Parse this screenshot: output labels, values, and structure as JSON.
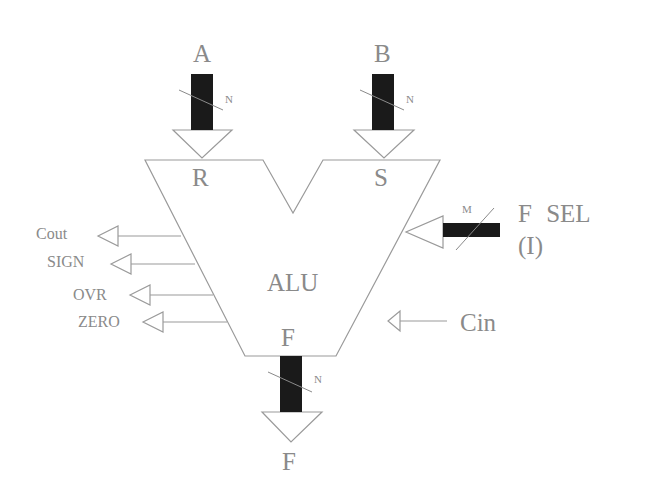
{
  "diagram": {
    "block_label": "ALU",
    "inputs": [
      {
        "name": "A",
        "port": "R",
        "width_label": "N"
      },
      {
        "name": "B",
        "port": "S",
        "width_label": "N"
      }
    ],
    "function_select": {
      "label_line1": "F SEL",
      "label_line2": "(I)",
      "width_label": "M"
    },
    "carry_in": {
      "label": "Cin"
    },
    "output": {
      "port": "F",
      "name": "F",
      "width_label": "N"
    },
    "status_outputs": [
      {
        "label": "Cout"
      },
      {
        "label": "SIGN"
      },
      {
        "label": "OVR"
      },
      {
        "label": "ZERO"
      }
    ],
    "colors": {
      "line": "#9a9a9a",
      "bus": "#1a1a1a",
      "text": "#8a8a8a"
    }
  }
}
